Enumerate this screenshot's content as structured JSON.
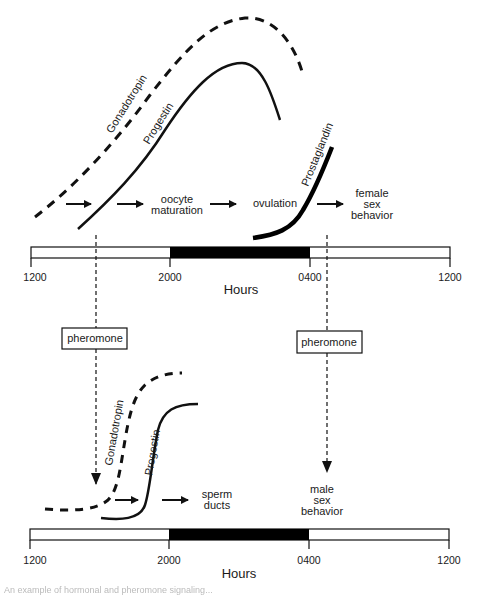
{
  "figure": {
    "female_panel": {
      "curves": {
        "gonadotropin": "Gonadotropin",
        "progestin": "Progestin",
        "prostaglandin": "Prostaglandin"
      },
      "events": {
        "oocyte_maturation_line1": "oocyte",
        "oocyte_maturation_line2": "maturation",
        "ovulation": "ovulation",
        "female_behavior_line1": "female",
        "female_behavior_line2": "sex",
        "female_behavior_line3": "behavior"
      },
      "time_axis": {
        "ticks": [
          "1200",
          "2000",
          "0400",
          "1200"
        ],
        "title": "Hours",
        "dark_period": {
          "start": "2000",
          "end": "0400"
        }
      }
    },
    "pheromone_boxes": {
      "left": "pheromone",
      "right": "pheromone"
    },
    "male_panel": {
      "curves": {
        "gonadotropin": "Gonadotropin",
        "progestin": "Progestin"
      },
      "events": {
        "sperm_ducts_line1": "sperm",
        "sperm_ducts_line2": "ducts",
        "male_behavior_line1": "male",
        "male_behavior_line2": "sex",
        "male_behavior_line3": "behavior"
      },
      "time_axis": {
        "ticks": [
          "1200",
          "2000",
          "0400",
          "1200"
        ],
        "title": "Hours",
        "dark_period": {
          "start": "2000",
          "end": "0400"
        }
      }
    },
    "caption": "An example of hormonal and pheromone signaling..."
  },
  "colors": {
    "ink": "#111111",
    "dark_period": "#000000",
    "background": "#ffffff"
  }
}
